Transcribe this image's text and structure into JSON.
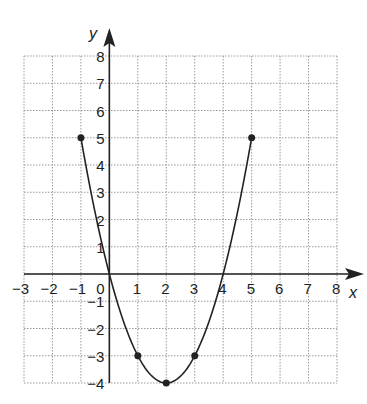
{
  "chart_data": {
    "type": "line",
    "title": "",
    "xlabel": "x",
    "ylabel": "y",
    "xlim": [
      -3,
      8
    ],
    "ylim": [
      -4,
      8
    ],
    "grid": true,
    "grid_style": "dotted",
    "x_ticks": [
      "-3",
      "-2",
      "-1",
      "0",
      "1",
      "2",
      "3",
      "4",
      "5",
      "6",
      "7",
      "8"
    ],
    "y_ticks": [
      "-4",
      "-3",
      "-2",
      "-1",
      "1",
      "2",
      "3",
      "4",
      "5",
      "6",
      "7",
      "8"
    ],
    "series": [
      {
        "name": "parabola",
        "equation": "y = x^2 - 4x",
        "x_range": [
          -1,
          5
        ],
        "points": [
          {
            "x": -1,
            "y": 5
          },
          {
            "x": 1,
            "y": -3
          },
          {
            "x": 2,
            "y": -4
          },
          {
            "x": 3,
            "y": -3
          },
          {
            "x": 5,
            "y": 5
          }
        ]
      }
    ],
    "colors": {
      "curve": "#222222",
      "grid": "#9a9a9a",
      "axis": "#222222"
    }
  }
}
